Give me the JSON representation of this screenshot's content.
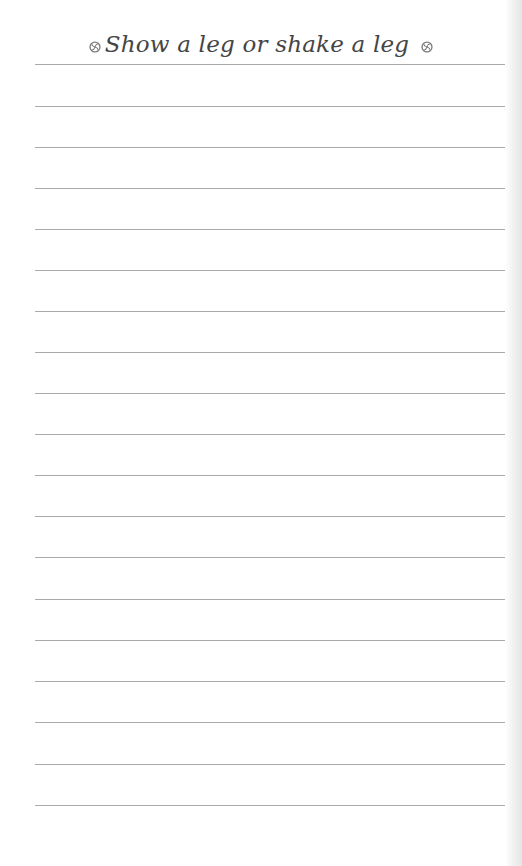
{
  "page": {
    "title": "Show a leg or shake a leg",
    "title_icon_left": "swirl-icon",
    "title_icon_right": "swirl-icon",
    "ruled_line_count": 19,
    "ruled_line_spacing_px": 41,
    "colors": {
      "paper": "#ffffff",
      "rule": "#8e8e8e",
      "title_ink": "#454545"
    }
  }
}
